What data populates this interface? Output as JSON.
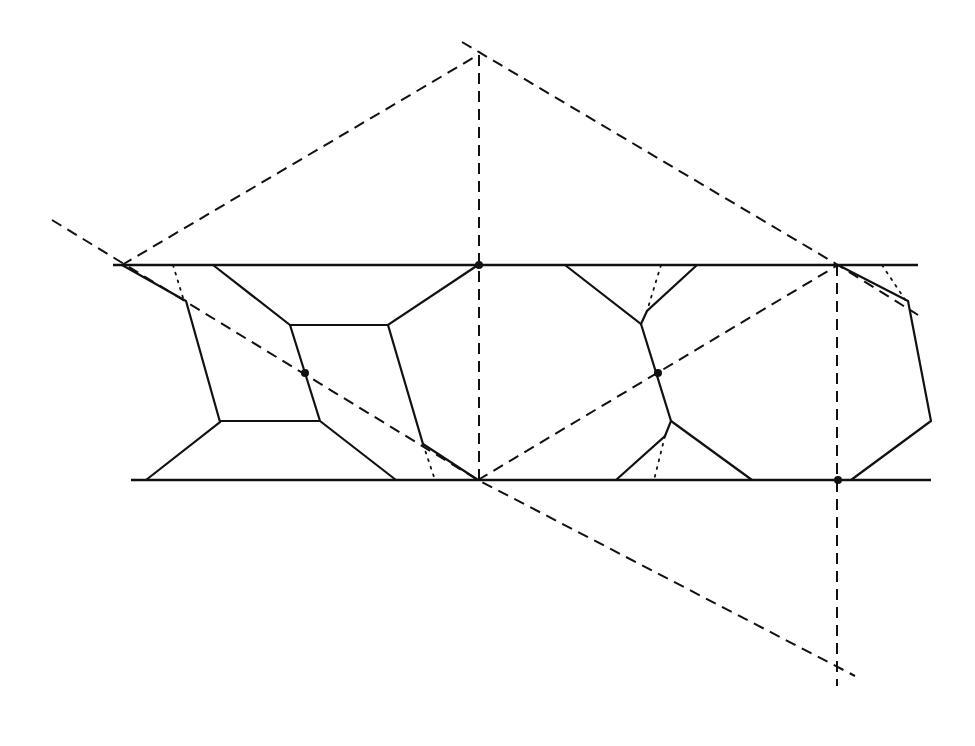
{
  "diagram": {
    "type": "geometric-construction",
    "colors": {
      "ink": "#111111",
      "background": "#ffffff"
    },
    "band_lines": [
      {
        "name": "top-boundary-line",
        "x1": 113,
        "y1": 265,
        "x2": 918,
        "y2": 265
      },
      {
        "name": "bottom-boundary-line",
        "x1": 131,
        "y1": 480,
        "x2": 931,
        "y2": 480
      }
    ],
    "dashed_lines": [
      {
        "name": "dashed-left-diagonal-down",
        "points": "52,220 478,480 855,676"
      },
      {
        "name": "dashed-left-to-apex",
        "points": "122,265 478,55"
      },
      {
        "name": "dashed-apex-to-right",
        "points": "462,42 838,265 918,315"
      },
      {
        "name": "dashed-vertical-center",
        "points": "479,55 479,480"
      },
      {
        "name": "dashed-bottom-to-right-top",
        "points": "478,480 838,265"
      },
      {
        "name": "dashed-vertical-right",
        "points": "837,265 837,686"
      }
    ],
    "solid_polylines": [
      {
        "name": "cell-left-outer-edge",
        "points": "122,265 186,301 220,422 146,480"
      },
      {
        "name": "cell-upper-trapezoid",
        "points": "213,265 290,325 388,325 478,265"
      },
      {
        "name": "cell-middle-left-edge",
        "points": "290,325 320,421"
      },
      {
        "name": "cell-lower-bar",
        "points": "220,421 320,421"
      },
      {
        "name": "cell-lower-right-diagonal",
        "points": "320,421 396,480"
      },
      {
        "name": "cell-right-edge",
        "points": "388,325 423,444 478,480"
      },
      {
        "name": "cell-center-upper",
        "points": "565,265 641,324 647,311 697,265"
      },
      {
        "name": "cell-center-spine",
        "points": "641,324 671,421 665,436 616,480"
      },
      {
        "name": "cell-center-lower-right",
        "points": "671,421 752,480"
      },
      {
        "name": "cell-right-polygon",
        "points": "838,265 908,301 931,421 851,480"
      }
    ],
    "dotted_lines": [
      {
        "name": "dotted-left-top",
        "points": "173,265 184,301"
      },
      {
        "name": "dotted-left-bottom",
        "points": "423,444 435,480"
      },
      {
        "name": "dotted-center-top",
        "points": "661,265 647,311"
      },
      {
        "name": "dotted-center-bottom",
        "points": "665,436 654,480"
      },
      {
        "name": "dotted-right-top",
        "points": "882,265 906,301"
      }
    ],
    "marked_points": [
      {
        "name": "point-top-center",
        "cx": 479,
        "cy": 265
      },
      {
        "name": "point-left-cell",
        "cx": 305,
        "cy": 373
      },
      {
        "name": "point-center-cell",
        "cx": 658,
        "cy": 373
      },
      {
        "name": "point-bottom-right",
        "cx": 838,
        "cy": 480
      }
    ]
  }
}
